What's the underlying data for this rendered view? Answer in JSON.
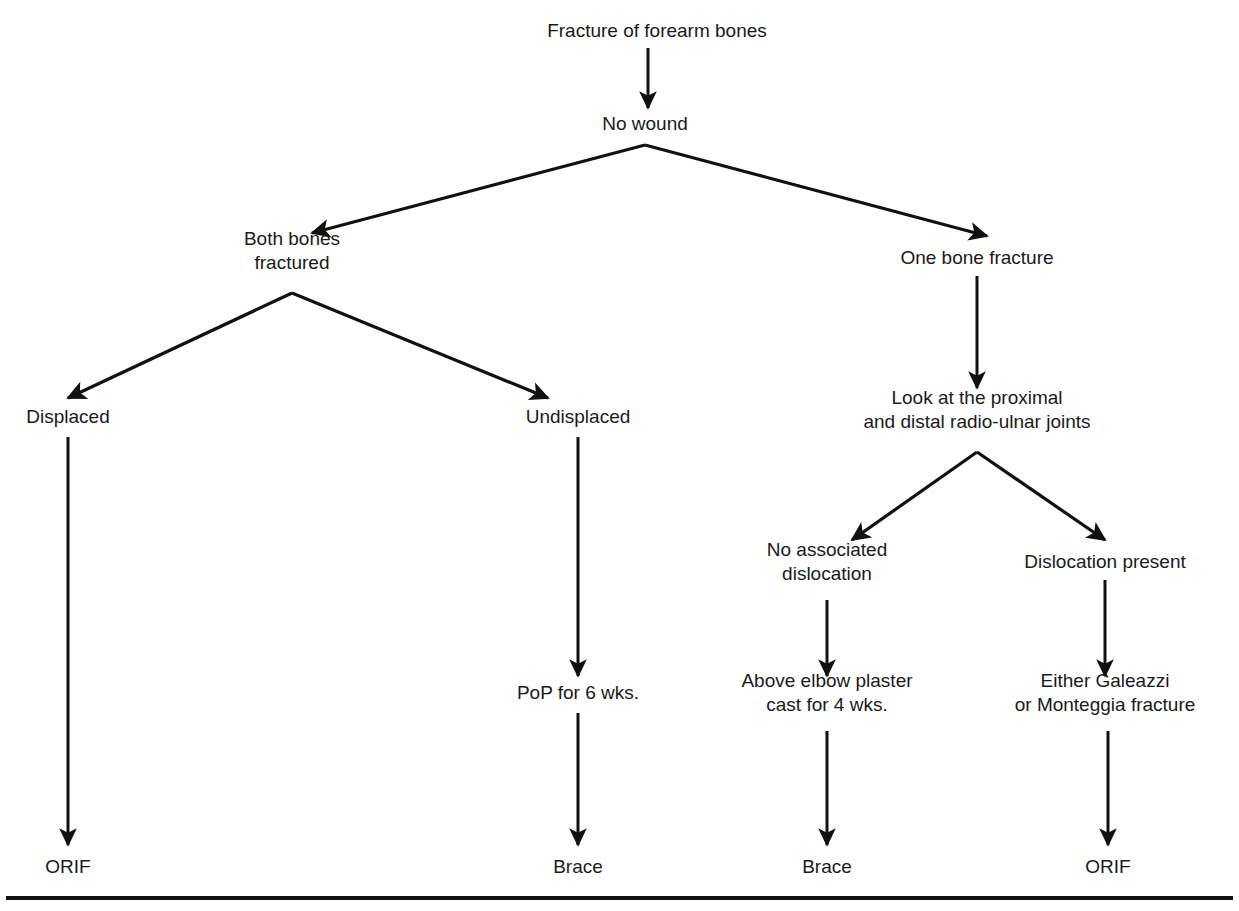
{
  "diagram": {
    "colors": {
      "ink": "#1a1a1a",
      "line": "#111111",
      "background": "#ffffff"
    },
    "nodes": [
      {
        "id": "root",
        "lines": [
          "Fracture of forearm bones"
        ],
        "x": 657,
        "y": 32
      },
      {
        "id": "no-wound",
        "lines": [
          "No wound"
        ],
        "x": 645,
        "y": 125
      },
      {
        "id": "both-bones",
        "lines": [
          "Both bones",
          "fractured"
        ],
        "x": 292,
        "y": 252
      },
      {
        "id": "one-bone",
        "lines": [
          "One bone fracture"
        ],
        "x": 977,
        "y": 259
      },
      {
        "id": "displaced",
        "lines": [
          "Displaced"
        ],
        "x": 68,
        "y": 418
      },
      {
        "id": "undisplaced",
        "lines": [
          "Undisplaced"
        ],
        "x": 578,
        "y": 418
      },
      {
        "id": "look-joints",
        "lines": [
          "Look at the proximal",
          "and distal radio-ulnar joints"
        ],
        "x": 977,
        "y": 411
      },
      {
        "id": "no-dislocation",
        "lines": [
          "No associated",
          "dislocation"
        ],
        "x": 827,
        "y": 563
      },
      {
        "id": "dislocation",
        "lines": [
          "Dislocation present"
        ],
        "x": 1105,
        "y": 563
      },
      {
        "id": "pop-6wks",
        "lines": [
          "PoP for 6 wks."
        ],
        "x": 578,
        "y": 694
      },
      {
        "id": "above-elbow",
        "lines": [
          "Above elbow plaster",
          "cast for 4 wks."
        ],
        "x": 827,
        "y": 694
      },
      {
        "id": "galeazzi",
        "lines": [
          "Either Galeazzi",
          "or Monteggia fracture"
        ],
        "x": 1105,
        "y": 694
      },
      {
        "id": "orif-left",
        "lines": [
          "ORIF"
        ],
        "x": 68,
        "y": 868
      },
      {
        "id": "brace-mid",
        "lines": [
          "Brace"
        ],
        "x": 578,
        "y": 868
      },
      {
        "id": "brace-right",
        "lines": [
          "Brace"
        ],
        "x": 827,
        "y": 868
      },
      {
        "id": "orif-right",
        "lines": [
          "ORIF"
        ],
        "x": 1108,
        "y": 868
      }
    ],
    "edges": [
      {
        "id": "root-to-no-wound",
        "from": "root",
        "to": "no-wound",
        "kind": "vertical",
        "x": 648,
        "y1": 48,
        "y2": 108
      },
      {
        "id": "no-wound-to-both-bones",
        "from": "no-wound",
        "to": "both-bones",
        "kind": "diagonal",
        "x1": 645,
        "y1": 145,
        "x2": 312,
        "y2": 233
      },
      {
        "id": "no-wound-to-one-bone",
        "from": "no-wound",
        "to": "one-bone",
        "kind": "diagonal",
        "x1": 645,
        "y1": 145,
        "x2": 987,
        "y2": 236
      },
      {
        "id": "both-bones-to-displaced",
        "from": "both-bones",
        "to": "displaced",
        "kind": "diagonal",
        "x1": 292,
        "y1": 293,
        "x2": 68,
        "y2": 398
      },
      {
        "id": "both-bones-to-undisp",
        "from": "both-bones",
        "to": "undisplaced",
        "kind": "diagonal",
        "x1": 292,
        "y1": 293,
        "x2": 548,
        "y2": 398
      },
      {
        "id": "one-bone-to-look",
        "from": "one-bone",
        "to": "look-joints",
        "kind": "vertical",
        "x": 977,
        "y1": 276,
        "y2": 388
      },
      {
        "id": "look-to-no-disloc",
        "from": "look-joints",
        "to": "no-dislocation",
        "kind": "diagonal",
        "x1": 977,
        "y1": 452,
        "x2": 852,
        "y2": 540
      },
      {
        "id": "look-to-disloc",
        "from": "look-joints",
        "to": "dislocation",
        "kind": "diagonal",
        "x1": 977,
        "y1": 452,
        "x2": 1105,
        "y2": 540
      },
      {
        "id": "displaced-to-orif",
        "from": "displaced",
        "to": "orif-left",
        "kind": "vertical",
        "x": 68,
        "y1": 437,
        "y2": 845
      },
      {
        "id": "undisp-to-pop",
        "from": "undisplaced",
        "to": "pop-6wks",
        "kind": "vertical",
        "x": 578,
        "y1": 437,
        "y2": 676
      },
      {
        "id": "no-disloc-to-above",
        "from": "no-dislocation",
        "to": "above-elbow",
        "kind": "vertical",
        "x": 827,
        "y1": 600,
        "y2": 676
      },
      {
        "id": "disloc-to-galeazzi",
        "from": "dislocation",
        "to": "galeazzi",
        "kind": "vertical",
        "x": 1105,
        "y1": 580,
        "y2": 676
      },
      {
        "id": "pop-to-brace",
        "from": "pop-6wks",
        "to": "brace-mid",
        "kind": "vertical",
        "x": 578,
        "y1": 713,
        "y2": 845
      },
      {
        "id": "above-to-brace",
        "from": "above-elbow",
        "to": "brace-right",
        "kind": "vertical",
        "x": 827,
        "y1": 731,
        "y2": 845
      },
      {
        "id": "galeazzi-to-orif",
        "from": "galeazzi",
        "to": "orif-right",
        "kind": "vertical",
        "x": 1108,
        "y1": 731,
        "y2": 845
      }
    ],
    "baseline_rule": {
      "x1": 6,
      "x2": 1233,
      "y": 898
    }
  }
}
